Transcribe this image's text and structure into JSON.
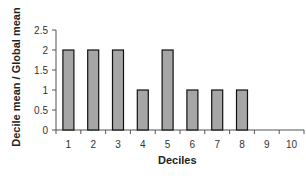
{
  "chart_data": {
    "type": "bar",
    "title": "",
    "xlabel": "Deciles",
    "ylabel": "Decile mean / Global mean",
    "categories": [
      "1",
      "2",
      "3",
      "4",
      "5",
      "6",
      "7",
      "8",
      "9",
      "10"
    ],
    "values": [
      2,
      2,
      2,
      1,
      2,
      1,
      1,
      1,
      0,
      0
    ],
    "ylim": [
      0,
      2.5
    ],
    "yticks": [
      "0",
      "0.5",
      "1",
      "1.5",
      "2",
      "2.5"
    ],
    "grid": false,
    "legend": "none",
    "colors": {
      "bar_fill": "#a6a6a6",
      "bar_stroke": "#111111",
      "axis": "#555555"
    }
  }
}
